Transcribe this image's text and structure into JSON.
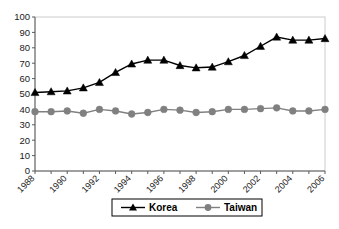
{
  "chart_data": {
    "type": "line",
    "title": "",
    "subtitle": "",
    "xlabel": "",
    "ylabel": "",
    "xlim": [
      1988,
      2006
    ],
    "ylim": [
      0,
      100
    ],
    "ytick_values": [
      0,
      10,
      20,
      30,
      40,
      50,
      60,
      70,
      80,
      90,
      100
    ],
    "ytick_labels": [
      "0",
      "10",
      "20",
      "30",
      "40",
      "50",
      "60",
      "70",
      "80",
      "90",
      "100"
    ],
    "x": [
      1988,
      1989,
      1990,
      1991,
      1992,
      1993,
      1994,
      1995,
      1996,
      1997,
      1998,
      1999,
      2000,
      2001,
      2002,
      2003,
      2004,
      2005,
      2006
    ],
    "xtick_labels": [
      "1988",
      "",
      "1990",
      "",
      "1992",
      "",
      "1994",
      "",
      "1996",
      "",
      "1998",
      "",
      "2000",
      "",
      "2002",
      "",
      "2004",
      "",
      "2006"
    ],
    "xtick_labels_shown": [
      "1988",
      "1990",
      "1992",
      "1994",
      "1996",
      "1998",
      "2000",
      "2002",
      "2004",
      "2006"
    ],
    "grid": false,
    "legend_position": "bottom",
    "series": [
      {
        "name": "Korea",
        "color": "#000000",
        "marker": "triangle",
        "values": [
          51,
          51.5,
          52,
          54,
          57.5,
          64,
          69.5,
          72,
          72,
          68.5,
          67,
          67.5,
          71,
          75,
          81,
          87,
          85,
          85,
          86
        ]
      },
      {
        "name": "Taiwan",
        "color": "#808080",
        "marker": "circle",
        "values": [
          38.5,
          38.5,
          39,
          37.5,
          40,
          39,
          37,
          38,
          40,
          39.5,
          38,
          38.5,
          40,
          40,
          40.5,
          41,
          39,
          39,
          40
        ]
      }
    ]
  },
  "legend": {
    "entries": [
      {
        "label": "Korea",
        "marker": "triangle-marker",
        "color": "#000000"
      },
      {
        "label": "Taiwan",
        "marker": "circle-marker",
        "color": "#808080"
      }
    ]
  },
  "colors": {
    "korea": "#000000",
    "taiwan": "#808080",
    "axis": "#5a5a5a",
    "plot_border": "#cccccc",
    "background": "#ffffff"
  }
}
